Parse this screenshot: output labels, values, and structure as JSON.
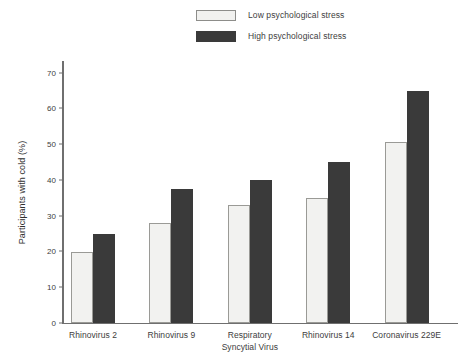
{
  "chart_data": {
    "type": "bar",
    "title": "",
    "xlabel": "",
    "ylabel": "Participants with cold (%)",
    "ylim": [
      0,
      73
    ],
    "yticks": [
      0,
      10,
      20,
      30,
      40,
      50,
      60,
      70
    ],
    "ytick_labels": [
      "0",
      "10",
      "20",
      "30",
      "40",
      "50",
      "60",
      "70"
    ],
    "grid": false,
    "legend_position": "top-center",
    "categories": [
      "Rhinovirus 2",
      "Rhinovirus 9",
      "Respiratory\nSyncytial Virus",
      "Rhinovirus 14",
      "Coronavirus 229E"
    ],
    "series": [
      {
        "name": "Low psychological stress",
        "color": "#f2f2f0",
        "values": [
          20,
          28,
          33,
          35,
          50.5
        ]
      },
      {
        "name": "High psychological stress",
        "color": "#3a3a3a",
        "values": [
          25,
          37.5,
          40,
          45,
          65
        ]
      }
    ]
  },
  "legend": {
    "items": [
      {
        "label": "Low psychological stress",
        "swatch": "low"
      },
      {
        "label": "High psychological stress",
        "swatch": "high"
      }
    ]
  },
  "axis": {
    "y_title": "Participants with cold (%)"
  }
}
